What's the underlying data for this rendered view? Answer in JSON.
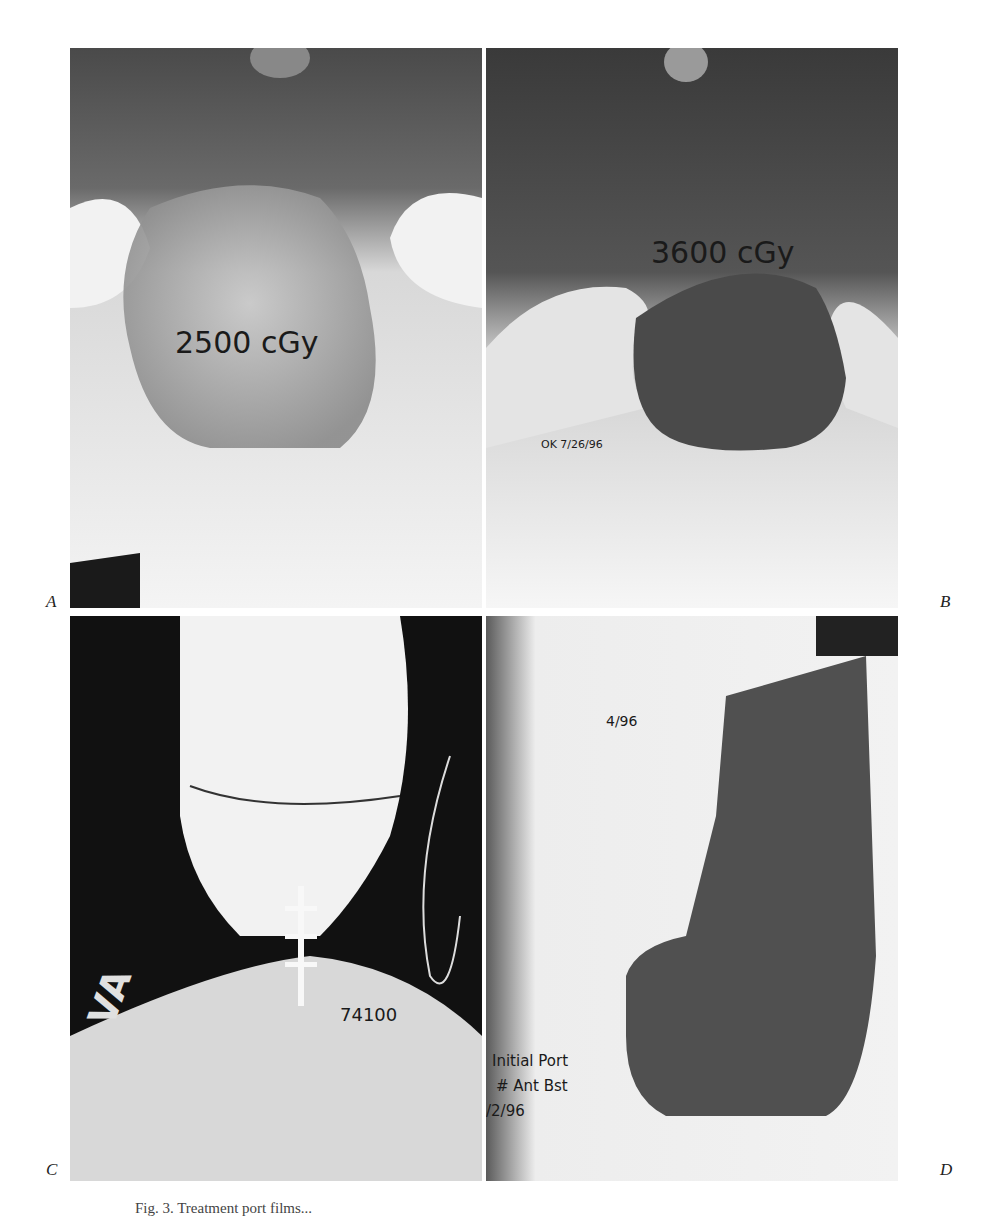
{
  "figure": {
    "panels": [
      {
        "id": "A",
        "label": "A",
        "annotations": [
          "2500 cGy"
        ]
      },
      {
        "id": "B",
        "label": "B",
        "annotations": [
          "3600 cGy",
          "OK 7/26/96"
        ]
      },
      {
        "id": "C",
        "label": "C",
        "annotations": [
          "VA",
          "74100"
        ]
      },
      {
        "id": "D",
        "label": "D",
        "annotations": [
          "4/96",
          "Initial Port",
          "# Ant Bst",
          "/2/96"
        ]
      }
    ],
    "caption_fragment": "Fig. 3. Treatment port films..."
  }
}
